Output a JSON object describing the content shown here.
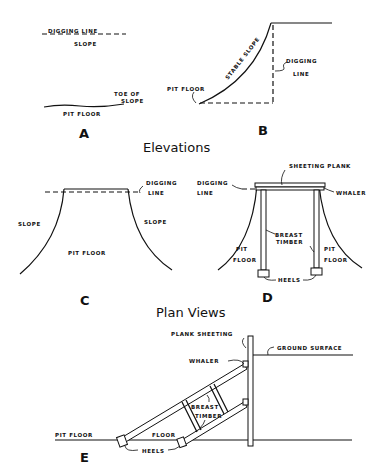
{
  "sections": {
    "elevations": "Elevations",
    "plan_views": "Plan Views"
  },
  "panels": {
    "A": {
      "letter": "A",
      "labels": {
        "digging_line": "DIGGING LINE",
        "slope": "SLOPE",
        "toe_of": "TOE OF",
        "toe_slope": "SLOPE",
        "pit_floor": "PIT FLOOR"
      }
    },
    "B": {
      "letter": "B",
      "labels": {
        "stable_slope": "STABLE SLOPE",
        "digging": "DIGGING",
        "line": "LINE",
        "pit_floor": "PIT FLOOR"
      }
    },
    "C": {
      "letter": "C",
      "labels": {
        "digging": "DIGGING",
        "line": "LINE",
        "slope_left": "SLOPE",
        "slope_right": "SLOPE",
        "pit_floor": "PIT FLOOR"
      }
    },
    "D": {
      "letter": "D",
      "labels": {
        "sheeting_plank": "SHEETING PLANK",
        "digging": "DIGGING",
        "line": "LINE",
        "whaler": "WHALER",
        "breast": "BREAST",
        "timber": "TIMBER",
        "pit_left": "PIT",
        "floor_left": "FLOOR",
        "pit_right": "PIT",
        "floor_right": "FLOOR",
        "heels": "HEELS"
      }
    },
    "E": {
      "letter": "E",
      "labels": {
        "plank_sheeting": "PLANK SHEETING",
        "ground_surface": "GROUND SURFACE",
        "whaler": "WHALER",
        "breast": "BREAST",
        "timber": "TIMBER",
        "pit_floor": "PIT FLOOR",
        "floor": "FLOOR",
        "heels": "HEELS"
      }
    }
  }
}
